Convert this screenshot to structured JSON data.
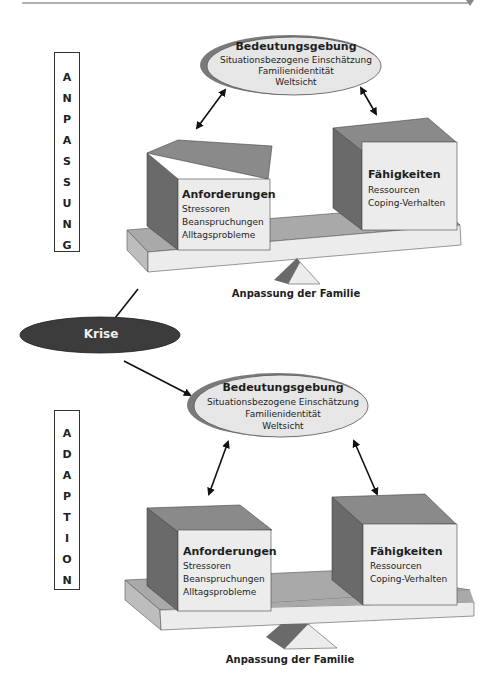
{
  "header_rule": {
    "color": "#555555"
  },
  "colors": {
    "box_front": "#ececec",
    "box_side": "#6a6a6a",
    "box_top": "#8a8a8a",
    "plank_top": "#a9a9a9",
    "plank_front": "#ececec",
    "plank_side": "#bdbdbd",
    "ellipse_fill": "#e6e6e6",
    "ellipse_shadow": "#7a7a7a",
    "krise_fill": "#3c3c3c",
    "text": "#1e1e1e"
  },
  "top": {
    "phase_label": [
      "A",
      "N",
      "P",
      "A",
      "S",
      "S",
      "U",
      "N",
      "G"
    ],
    "ellipse": {
      "title": "Bedeutungsgebung",
      "lines": [
        "Situationsbezogene Einschätzung",
        "Familienidentität",
        "Weltsicht"
      ]
    },
    "left_box": {
      "title": "Anforderungen",
      "lines": [
        "Stressoren",
        "Beanspruchungen",
        "Alltagsprobleme"
      ]
    },
    "right_box": {
      "title": "Fähigkeiten",
      "lines": [
        "Ressourcen",
        "Coping-Verhalten"
      ]
    },
    "caption": "Anpassung der Familie"
  },
  "krise": {
    "label": "Krise"
  },
  "bottom": {
    "phase_label": [
      "A",
      "D",
      "A",
      "P",
      "T",
      "I",
      "O",
      "N"
    ],
    "ellipse": {
      "title": "Bedeutungsgebung",
      "lines": [
        "Situationsbezogene Einschätzung",
        "Familienidentität",
        "Weltsicht"
      ]
    },
    "left_box": {
      "title": "Anforderungen",
      "lines": [
        "Stressoren",
        "Beanspruchungen",
        "Alltagsprobleme"
      ]
    },
    "right_box": {
      "title": "Fähigkeiten",
      "lines": [
        "Ressourcen",
        "Coping-Verhalten"
      ]
    },
    "caption": "Anpassung der Familie"
  }
}
